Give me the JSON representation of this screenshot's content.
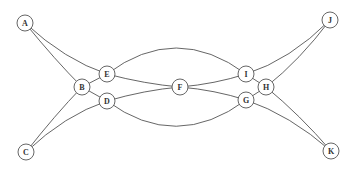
{
  "diagram": {
    "type": "graph",
    "node_radius": 8,
    "colors": {
      "stroke": "#555555",
      "fill": "#ffffff",
      "label": "#333333"
    },
    "nodes": [
      {
        "id": "A",
        "label": "A",
        "x": 25,
        "y": 23
      },
      {
        "id": "B",
        "label": "B",
        "x": 82,
        "y": 87
      },
      {
        "id": "C",
        "label": "C",
        "x": 26,
        "y": 152
      },
      {
        "id": "D",
        "label": "D",
        "x": 107,
        "y": 101
      },
      {
        "id": "E",
        "label": "E",
        "x": 107,
        "y": 74
      },
      {
        "id": "F",
        "label": "F",
        "x": 180,
        "y": 87
      },
      {
        "id": "G",
        "label": "G",
        "x": 246,
        "y": 100
      },
      {
        "id": "H",
        "label": "H",
        "x": 266,
        "y": 87
      },
      {
        "id": "I",
        "label": "I",
        "x": 246,
        "y": 74
      },
      {
        "id": "J",
        "label": "J",
        "x": 330,
        "y": 20
      },
      {
        "id": "K",
        "label": "K",
        "x": 331,
        "y": 151
      }
    ],
    "edges": [
      {
        "from": "A",
        "to": "B",
        "path": "M25,23 Q55,60 82,87"
      },
      {
        "from": "A",
        "to": "E",
        "path": "M25,23 Q65,60 107,74"
      },
      {
        "from": "C",
        "to": "B",
        "path": "M26,152 Q55,115 82,87"
      },
      {
        "from": "C",
        "to": "D",
        "path": "M26,152 Q65,115 107,101"
      },
      {
        "from": "B",
        "to": "E",
        "path": "M82,87 L107,74"
      },
      {
        "from": "B",
        "to": "D",
        "path": "M82,87 L107,101"
      },
      {
        "from": "E",
        "to": "F",
        "path": "M107,74 Q145,84 180,87"
      },
      {
        "from": "D",
        "to": "F",
        "path": "M107,101 Q145,90 180,87"
      },
      {
        "from": "E",
        "to": "I",
        "path": "M107,74 Q176,22 246,74"
      },
      {
        "from": "D",
        "to": "G",
        "path": "M107,101 Q176,152 246,100"
      },
      {
        "from": "F",
        "to": "I",
        "path": "M180,87 Q215,84 246,74"
      },
      {
        "from": "F",
        "to": "G",
        "path": "M180,87 Q215,90 246,100"
      },
      {
        "from": "I",
        "to": "H",
        "path": "M246,74 L266,87"
      },
      {
        "from": "G",
        "to": "H",
        "path": "M246,100 L266,87"
      },
      {
        "from": "I",
        "to": "J",
        "path": "M246,74 Q290,60 330,20"
      },
      {
        "from": "H",
        "to": "J",
        "path": "M266,87 Q300,60 330,20"
      },
      {
        "from": "G",
        "to": "K",
        "path": "M246,100 Q290,115 331,151"
      },
      {
        "from": "H",
        "to": "K",
        "path": "M266,87 Q300,115 331,151"
      }
    ]
  }
}
